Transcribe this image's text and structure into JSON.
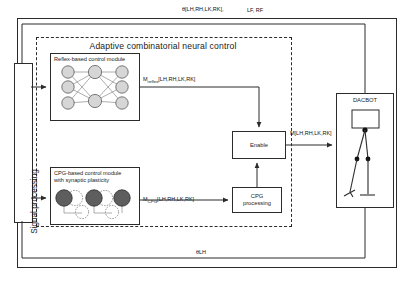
{
  "diagram": {
    "title": "Adaptive combinatorial neural control",
    "top_feedback_label": "θ[LH,RH,LK,RK],",
    "top_feedback_label_2": "LF, RF",
    "bottom_feedback_label": "θLH",
    "signal_processing_label": "Signal processing",
    "modules": {
      "reflex": {
        "title": "Reflex-based control module"
      },
      "cpg": {
        "title_line1": "CPG-based control module",
        "title_line2": "with synaptic plasticity"
      },
      "enable": {
        "label": "Enable"
      },
      "cpg_processing": {
        "label_line1": "CPG",
        "label_line2": "processing"
      },
      "robot": {
        "label": "DACBOT"
      }
    },
    "connections": {
      "reflex_output": "M reflex[LH,RH,LK,RK]",
      "reflex_output_main": "M",
      "reflex_output_sub": "reflex",
      "reflex_output_rest": "[LH,RH,LK,RK]",
      "cpg_output_main": "M",
      "cpg_output_sub": "CPG",
      "cpg_output_rest": "[LH,RH,LK,RK]",
      "motor_output_main": "M",
      "motor_output_rest": "[LH,RH,LK,RK]"
    },
    "colors": {
      "line": "#2b2b2b",
      "node_fill": "#d6d6d6",
      "node_dark_fill": "#5e5e5e",
      "background": "#ffffff"
    }
  }
}
